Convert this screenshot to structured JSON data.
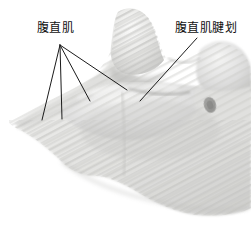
{
  "figure": {
    "kind": "anatomical-illustration",
    "background_color": "#ffffff",
    "line_color": "#1a1a1a",
    "text_color": "#111111"
  },
  "labels": [
    {
      "id": "rectus-abdominis",
      "text": "腹直肌",
      "x": 37,
      "y": 22,
      "leader_origin": {
        "x": 60,
        "y": 45
      },
      "leader_ends": [
        {
          "x": 42,
          "y": 120
        },
        {
          "x": 62,
          "y": 119
        },
        {
          "x": 90,
          "y": 101
        },
        {
          "x": 127,
          "y": 90
        }
      ]
    },
    {
      "id": "tendinous-intersection",
      "text": "腹直肌腱划",
      "x": 175,
      "y": 22,
      "leader_origin": {
        "x": 197,
        "y": 38
      },
      "leader_ends": [
        {
          "x": 140,
          "y": 101
        }
      ]
    }
  ],
  "anatomy_features": [
    {
      "name": "umbilicus",
      "x": 210,
      "y": 105,
      "rx": 6,
      "ry": 8
    },
    {
      "name": "rectus-abdominis-peak",
      "x": 140,
      "y": 40
    },
    {
      "name": "secondary-muscle-bulge",
      "x": 225,
      "y": 60
    }
  ],
  "palette": {
    "tissue_light": "#f2f2f0",
    "tissue_mid": "#dcdcda",
    "tissue_shadow": "#bdbdbb",
    "tissue_deep_shadow": "#9d9d9b",
    "striation": "#c8c8c6",
    "umbilicus": "#8a8a88"
  }
}
